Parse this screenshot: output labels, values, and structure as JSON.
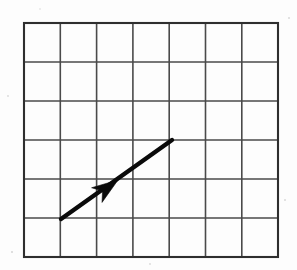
{
  "figure": {
    "background_color": "#fdfdfd",
    "width": 297,
    "height": 270
  },
  "grid": {
    "name": "square-grid",
    "columns": 7,
    "rows": 6,
    "left": 24,
    "top": 23,
    "right": 278,
    "bottom": 257,
    "cell_width": 36.3,
    "cell_height": 39.0,
    "line_color": "#4a4a4a",
    "border_color": "#2e2e2e",
    "line_width": 1.6,
    "border_width": 2.1,
    "x_positions": [
      24,
      60.3,
      96.6,
      132.9,
      169.2,
      205.5,
      241.8,
      278
    ],
    "y_positions": [
      23,
      62,
      101,
      140,
      179,
      218,
      257
    ]
  },
  "vector": {
    "name": "displacement-vector",
    "color": "#0a0a0a",
    "shaft_width": 4.4,
    "tail": {
      "x": 61,
      "y": 219,
      "grid_col": 1,
      "grid_row": 5
    },
    "tip": {
      "x": 172,
      "y": 140,
      "grid_col": 4,
      "grid_row": 3
    },
    "components": {
      "dx_cells": 3,
      "dy_cells": -2
    },
    "head": {
      "name": "arrowhead",
      "position": {
        "x": 118,
        "y": 180
      },
      "length": 26,
      "half_width": 9,
      "notch": 7,
      "placement": "mid-shaft"
    }
  },
  "specks": [
    {
      "x": 12,
      "y": 252,
      "r": 1.1
    },
    {
      "x": 289,
      "y": 18,
      "r": 1.0
    },
    {
      "x": 8,
      "y": 96,
      "r": 0.9
    },
    {
      "x": 285,
      "y": 200,
      "r": 1.0
    },
    {
      "x": 150,
      "y": 264,
      "r": 0.9
    },
    {
      "x": 40,
      "y": 9,
      "r": 0.8
    }
  ]
}
